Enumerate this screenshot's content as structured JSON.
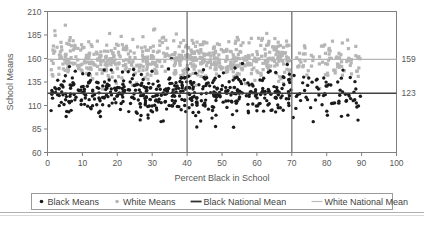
{
  "chart_data": {
    "type": "scatter",
    "title": "",
    "xlabel": "Percent Black in School",
    "ylabel": "School Means",
    "xlim": [
      0,
      100
    ],
    "ylim": [
      60,
      210
    ],
    "xticks": [
      "0",
      "10",
      "20",
      "30",
      "40",
      "50",
      "60",
      "70",
      "80",
      "90",
      "100"
    ],
    "yticks": [
      "60",
      "85",
      "110",
      "135",
      "160",
      "185",
      "210"
    ],
    "grid": false,
    "legend_position": "bottom",
    "series": [
      {
        "name": "Black Means",
        "type": "scatter",
        "marker": "filled-circle",
        "color": "#1a1a1a",
        "mean_y": 123,
        "x_range": [
          0,
          90
        ],
        "y_spread": [
          85,
          165
        ],
        "n_points": 560
      },
      {
        "name": "White Means",
        "type": "scatter",
        "marker": "filled-square",
        "color": "#b5b5b5",
        "mean_y": 159,
        "x_range": [
          0,
          90
        ],
        "y_spread": [
          130,
          200
        ],
        "n_points": 700
      },
      {
        "name": "Black National Mean",
        "type": "hline",
        "color": "#404040",
        "value": 123
      },
      {
        "name": "White National Mean",
        "type": "hline",
        "color": "#b5b5b5",
        "value": 159
      }
    ],
    "reference_lines_vertical": [
      {
        "name": "vline-40",
        "value": 40,
        "color": "#707070"
      },
      {
        "name": "vline-70",
        "value": 70,
        "color": "#707070"
      }
    ],
    "right_axis_labels": [
      {
        "name": "white-national-mean-label",
        "text": "159",
        "value": 159
      },
      {
        "name": "black-national-mean-label",
        "text": "123",
        "value": 123
      }
    ],
    "legend": [
      {
        "label": "Black Means",
        "marker": "dot",
        "color": "#1a1a1a"
      },
      {
        "label": "White Means",
        "marker": "dot",
        "color": "#b5b5b5"
      },
      {
        "label": "Black National Mean",
        "marker": "line",
        "color": "#303030"
      },
      {
        "label": "White National Mean",
        "marker": "line",
        "color": "#bcbcbc"
      }
    ]
  },
  "colors": {
    "black_series": "#1a1a1a",
    "white_series": "#b5b5b5",
    "axis": "#808080",
    "text": "#595959",
    "reference_vertical": "#707070",
    "black_mean_line": "#404040",
    "white_mean_line": "#b5b5b5",
    "legend_border": "#9a9a9a",
    "page_rule": "#b0b0b0"
  }
}
